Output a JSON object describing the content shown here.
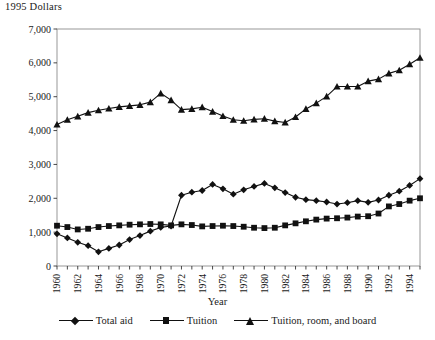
{
  "chart_data": {
    "type": "line",
    "title": "",
    "ylabel": "1995 Dollars",
    "xlabel": "Year",
    "ylim": [
      0,
      7000
    ],
    "yticks": [
      0,
      1000,
      2000,
      3000,
      4000,
      5000,
      6000,
      7000
    ],
    "ytick_labels": [
      "0",
      "1,000",
      "2,000",
      "3,000",
      "4,000",
      "5,000",
      "6,000",
      "7,000"
    ],
    "grid": false,
    "legend_position": "bottom",
    "xlim": [
      1960,
      1995
    ],
    "x": [
      1960,
      1961,
      1962,
      1963,
      1964,
      1965,
      1966,
      1967,
      1968,
      1969,
      1970,
      1971,
      1972,
      1973,
      1974,
      1975,
      1976,
      1977,
      1978,
      1979,
      1980,
      1981,
      1982,
      1983,
      1984,
      1985,
      1986,
      1987,
      1988,
      1989,
      1990,
      1991,
      1992,
      1993,
      1994,
      1995
    ],
    "xtick_labels": [
      "1960",
      "1961",
      "1962",
      "1963",
      "1964",
      "1965",
      "1966",
      "1967",
      "1968",
      "1969",
      "1970",
      "1971",
      "1972",
      "1973",
      "1974",
      "1975",
      "1976",
      "1977",
      "1978",
      "1979",
      "1980",
      "1981",
      "1982",
      "1983",
      "1984",
      "1985",
      "1986",
      "1987",
      "1988",
      "1989",
      "1990",
      "1991",
      "1992",
      "1993",
      "1994",
      "1995"
    ],
    "xtick_labels_visible": [
      "1960",
      "",
      "1962",
      "",
      "1964",
      "",
      "1966",
      "",
      "1968",
      "",
      "1970",
      "",
      "1972",
      "",
      "1974",
      "",
      "1976",
      "",
      "1978",
      "",
      "1980",
      "",
      "1982",
      "",
      "1984",
      "",
      "1986",
      "",
      "1988",
      "",
      "1990",
      "",
      "1992",
      "",
      "1994",
      ""
    ],
    "series": [
      {
        "name": "Total aid",
        "marker": "diamond",
        "values": [
          950,
          830,
          700,
          600,
          420,
          520,
          620,
          780,
          900,
          1030,
          1140,
          1180,
          2090,
          2180,
          2230,
          2410,
          2280,
          2120,
          2250,
          2350,
          2440,
          2310,
          2170,
          2030,
          1960,
          1930,
          1890,
          1830,
          1870,
          1930,
          1880,
          1950,
          2090,
          2210,
          2380,
          2580
        ]
      },
      {
        "name": "Tuition",
        "marker": "square",
        "values": [
          1190,
          1150,
          1080,
          1100,
          1150,
          1180,
          1200,
          1220,
          1230,
          1240,
          1230,
          1200,
          1230,
          1210,
          1170,
          1180,
          1190,
          1180,
          1160,
          1130,
          1120,
          1130,
          1200,
          1260,
          1320,
          1370,
          1400,
          1410,
          1430,
          1460,
          1470,
          1550,
          1760,
          1830,
          1930,
          2000
        ]
      },
      {
        "name": "Tuition, room, and board",
        "marker": "triangle",
        "values": [
          4180,
          4320,
          4420,
          4530,
          4600,
          4650,
          4700,
          4730,
          4760,
          4840,
          5100,
          4900,
          4620,
          4640,
          4690,
          4560,
          4430,
          4320,
          4290,
          4330,
          4350,
          4280,
          4240,
          4400,
          4640,
          4810,
          5010,
          5300,
          5300,
          5300,
          5460,
          5520,
          5690,
          5780,
          5960,
          6150
        ]
      }
    ]
  }
}
